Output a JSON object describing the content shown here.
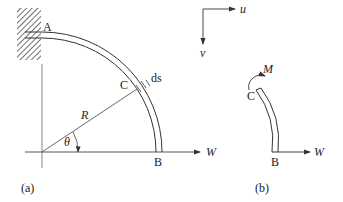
{
  "figure_a": {
    "caption": "(a)",
    "labels": {
      "A": "A",
      "B": "B",
      "C": "C",
      "R": "R",
      "theta": "θ",
      "ds": "ds",
      "W": "W"
    }
  },
  "figure_b": {
    "caption": "(b)",
    "labels": {
      "C": "C",
      "B": "B",
      "M": "M",
      "W": "W"
    }
  },
  "axes": {
    "u": "u",
    "v": "v"
  },
  "colors": {
    "line": "#333333",
    "background": "#ffffff"
  }
}
